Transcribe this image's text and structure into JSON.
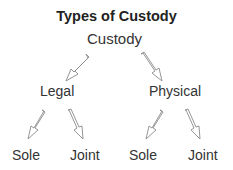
{
  "title": "Types of Custody",
  "root": {
    "label": "Custody"
  },
  "level1": [
    {
      "label": "Legal"
    },
    {
      "label": "Physical"
    }
  ],
  "level2": [
    {
      "parent": "Legal",
      "label": "Sole"
    },
    {
      "parent": "Legal",
      "label": "Joint"
    },
    {
      "parent": "Physical",
      "label": "Sole"
    },
    {
      "parent": "Physical",
      "label": "Joint"
    }
  ],
  "colors": {
    "text": "#333333",
    "arrow_outline": "#8a8a8a",
    "background": "#ffffff"
  }
}
